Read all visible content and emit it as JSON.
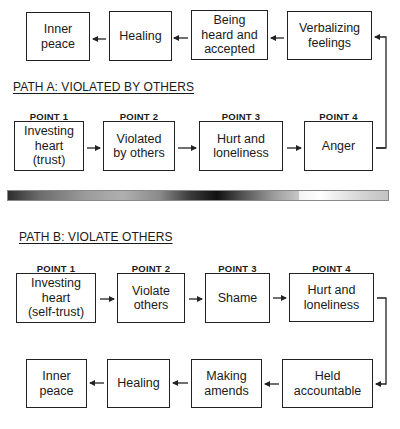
{
  "top_cycle": {
    "boxes": [
      {
        "label": "Inner\npeace"
      },
      {
        "label": "Healing"
      },
      {
        "label": "Being\nheard and\naccepted"
      },
      {
        "label": "Verbalizing\nfeelings"
      }
    ]
  },
  "path_a": {
    "heading": "PATH A:  VIOLATED BY OTHERS",
    "points": [
      {
        "point": "POINT 1",
        "label": "Investing\nheart\n(trust)"
      },
      {
        "point": "POINT 2",
        "label": "Violated\nby others"
      },
      {
        "point": "POINT 3",
        "label": "Hurt and\nloneliness"
      },
      {
        "point": "POINT 4",
        "label": "Anger"
      }
    ]
  },
  "divider": {
    "type": "gradient-bar"
  },
  "path_b": {
    "heading": "PATH B:  VIOLATE OTHERS",
    "points": [
      {
        "point": "POINT 1",
        "label": "Investing\nheart\n(self-trust)"
      },
      {
        "point": "POINT 2",
        "label": "Violate\nothers"
      },
      {
        "point": "POINT 3",
        "label": "Shame"
      },
      {
        "point": "POINT 4",
        "label": "Hurt and\nloneliness"
      }
    ],
    "recovery": [
      {
        "label": "Inner\npeace"
      },
      {
        "label": "Healing"
      },
      {
        "label": "Making\namends"
      },
      {
        "label": "Held\naccountable"
      }
    ]
  },
  "colors": {
    "line": "#222222",
    "background": "#ffffff"
  }
}
